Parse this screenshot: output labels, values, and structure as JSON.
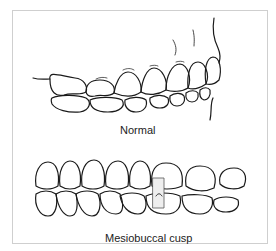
{
  "figure": {
    "panels": [
      {
        "id": "normal",
        "caption": "Normal"
      },
      {
        "id": "mesiobuccal",
        "caption": "Mesiobuccal cusp"
      }
    ],
    "colors": {
      "line": "#1a1a1a",
      "frame": "#cfcfcf",
      "highlight_box": "#eeeeee"
    }
  }
}
